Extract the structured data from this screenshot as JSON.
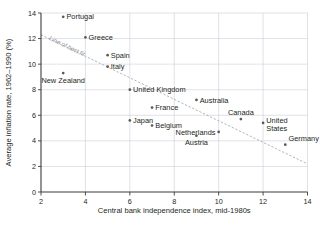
{
  "chart_data": {
    "type": "scatter",
    "title": "",
    "xlabel": "Central bank independence index, mid-1980s",
    "ylabel": "Average inflation rate, 1962–1990 (%)",
    "xlim": [
      2,
      14
    ],
    "ylim": [
      0,
      14
    ],
    "xticks": [
      "2",
      "4",
      "6",
      "8",
      "10",
      "12",
      "14"
    ],
    "yticks": [
      "0",
      "2",
      "4",
      "6",
      "8",
      "10",
      "12",
      "14"
    ],
    "xtick_values": [
      2,
      4,
      6,
      8,
      10,
      12,
      14
    ],
    "ytick_values": [
      0,
      2,
      4,
      6,
      8,
      10,
      12,
      14
    ],
    "grid": true,
    "legend": "none",
    "points": [
      {
        "label": "Portugal",
        "x": 3,
        "y": 13.7,
        "label_pos": "right"
      },
      {
        "label": "Greece",
        "x": 4,
        "y": 12.1,
        "label_pos": "right"
      },
      {
        "label": "Spain",
        "x": 5,
        "y": 10.7,
        "label_pos": "right"
      },
      {
        "label": "Italy",
        "x": 5,
        "y": 9.8,
        "label_pos": "right"
      },
      {
        "label": "New Zealand",
        "x": 3,
        "y": 9.3,
        "label_pos": "below"
      },
      {
        "label": "United Kingdom",
        "x": 6,
        "y": 8.0,
        "label_pos": "right"
      },
      {
        "label": "Australia",
        "x": 9,
        "y": 7.2,
        "label_pos": "right"
      },
      {
        "label": "France",
        "x": 7,
        "y": 6.6,
        "label_pos": "right"
      },
      {
        "label": "Canada",
        "x": 11,
        "y": 5.7,
        "label_pos": "above"
      },
      {
        "label": "Japan",
        "x": 6,
        "y": 5.6,
        "label_pos": "right"
      },
      {
        "label": "United States",
        "x": 12,
        "y": 5.4,
        "label_pos": "right-two-line"
      },
      {
        "label": "Belgium",
        "x": 7,
        "y": 5.2,
        "label_pos": "right"
      },
      {
        "label": "Netherlands",
        "x": 10,
        "y": 4.7,
        "label_pos": "left"
      },
      {
        "label": "Austria",
        "x": 9,
        "y": 4.4,
        "label_pos": "below"
      },
      {
        "label": "Germany",
        "x": 13,
        "y": 3.7,
        "label_pos": "above-right"
      }
    ],
    "annotations": [
      {
        "text": "Line of best fit",
        "kind": "trend-line-label"
      }
    ],
    "trend_line": {
      "x_start": 2,
      "y_start": 12.3,
      "x_end": 14,
      "y_end": 2.2,
      "style": "dashed"
    },
    "colors": {
      "marker": "#55595e",
      "grid": "#c9cfd6",
      "axis": "#3b3b3b",
      "trend": "#9aa0a6",
      "text": "#231f20",
      "background": "#ffffff"
    }
  }
}
